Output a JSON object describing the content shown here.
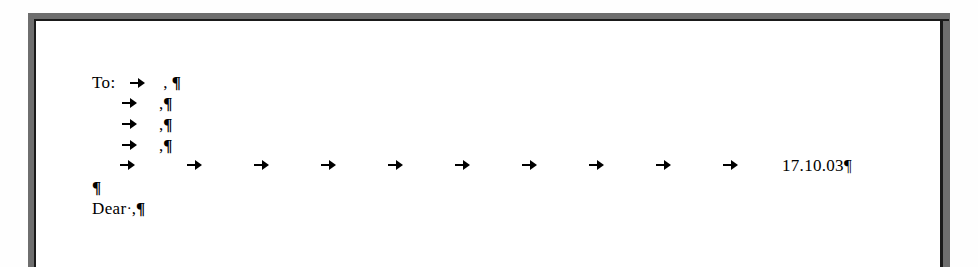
{
  "document": {
    "kind": "word-processor-scan",
    "formatting_marks_visible": true,
    "colors": {
      "page_background": "#ffffff",
      "text": "#000000",
      "frame_shadow": "#6e6e6e",
      "frame_border": "#1a1a1a"
    },
    "lines": [
      {
        "id": "to-line",
        "label": "To:",
        "tab_marks": 1,
        "comma": ",",
        "pilcrow": "¶"
      },
      {
        "id": "recipient-line-2",
        "label": "",
        "tab_marks": 1,
        "comma": ",",
        "pilcrow": "¶"
      },
      {
        "id": "recipient-line-3",
        "label": "",
        "tab_marks": 1,
        "comma": ",",
        "pilcrow": "¶"
      },
      {
        "id": "recipient-line-4",
        "label": "",
        "tab_marks": 1,
        "comma": ",",
        "pilcrow": "¶"
      },
      {
        "id": "date-line",
        "tab_marks": 10,
        "date": "17.10.03",
        "pilcrow": "¶"
      },
      {
        "id": "empty-line",
        "pilcrow": "¶"
      },
      {
        "id": "salutation-line",
        "label": "Dear",
        "space_dot": "·",
        "comma": ",",
        "pilcrow": "¶"
      }
    ],
    "glyphs": {
      "tab_arrow": "→",
      "pilcrow": "¶",
      "space_dot": "·"
    },
    "date_line_tab_positions": [
      28,
      95,
      162,
      229,
      296,
      363,
      430,
      497,
      564,
      631
    ],
    "date_x": 690
  }
}
